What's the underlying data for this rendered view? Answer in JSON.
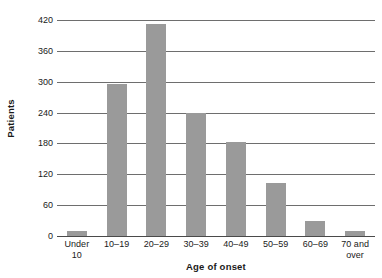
{
  "chart_data": {
    "type": "bar",
    "title": "",
    "xlabel": "Age of onset",
    "ylabel": "Patients",
    "categories": [
      "Under\n10",
      "10–19",
      "20–29",
      "30–39",
      "40–49",
      "50–59",
      "60–69",
      "70 and\nover"
    ],
    "values": [
      10,
      295,
      412,
      240,
      182,
      103,
      30,
      10
    ],
    "ylim": [
      0,
      420
    ],
    "yticks": [
      0,
      60,
      120,
      180,
      240,
      300,
      360,
      420
    ],
    "ytick_labels": [
      "0",
      "60",
      "120",
      "180",
      "240",
      "300",
      "360",
      "420"
    ],
    "grid": true,
    "grid_axis": "y",
    "legend": false,
    "bar_color": "#9a9a9a",
    "gridline_color": "#6e6e6e",
    "axis_color": "#4a4a4a",
    "text_color": "#1a1a1a",
    "background": "#ffffff"
  }
}
